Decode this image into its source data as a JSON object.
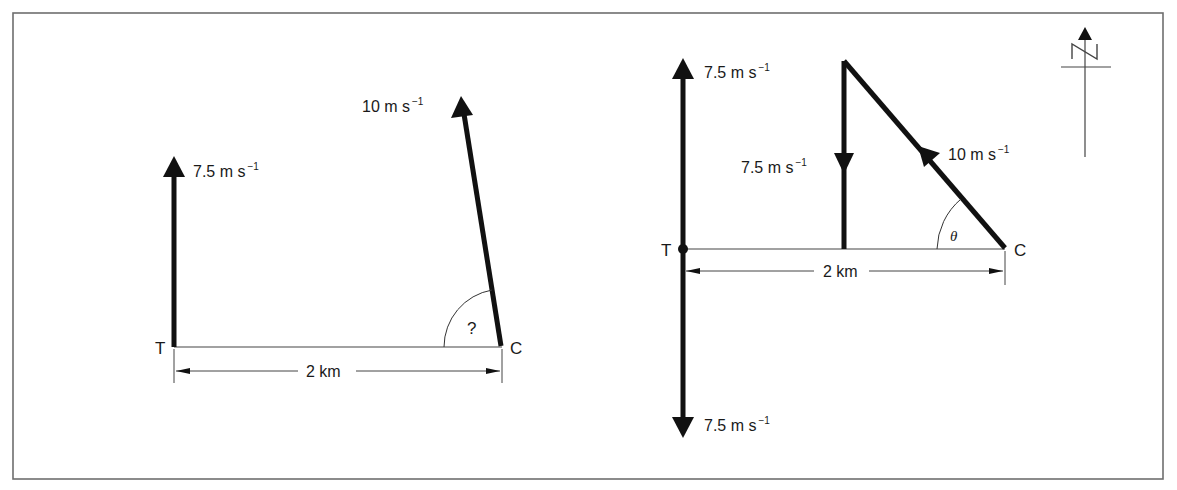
{
  "figure": {
    "frame_color": "#6e6e6e",
    "ink_color": "#111111",
    "thin_line_color": "#444444"
  },
  "left_diagram": {
    "point_T": "T",
    "point_C": "C",
    "vector_T": {
      "value": "7.5 m s",
      "exp": "−1",
      "direction": "north"
    },
    "vector_C": {
      "value": "10 m s",
      "exp": "−1",
      "direction": "north of west"
    },
    "angle_label": "?",
    "distance_label": "2 km"
  },
  "right_diagram": {
    "point_T": "T",
    "point_C": "C",
    "vector_T_up": {
      "value": "7.5 m s",
      "exp": "−1",
      "direction": "north"
    },
    "vector_T_down": {
      "value": "7.5 m s",
      "exp": "−1",
      "direction": "south"
    },
    "vector_mid_down": {
      "value": "7.5 m s",
      "exp": "−1",
      "direction": "south"
    },
    "vector_C": {
      "value": "10 m s",
      "exp": "−1",
      "direction": "north-west"
    },
    "angle_label": "θ",
    "distance_label": "2 km"
  },
  "compass": {
    "label": "N",
    "icon": "north-arrow-icon"
  }
}
